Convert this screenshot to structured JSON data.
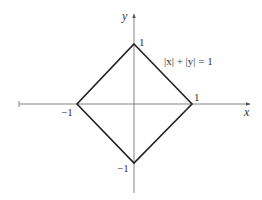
{
  "diagram": {
    "equation": "|x| + |y| = 1",
    "axes": {
      "x_label": "x",
      "y_label": "y"
    },
    "vertices": [
      {
        "name": "top",
        "x": 0,
        "y": 1,
        "label": "1"
      },
      {
        "name": "right",
        "x": 1,
        "y": 0,
        "label": "1"
      },
      {
        "name": "left",
        "x": -1,
        "y": 0,
        "label": "−1"
      },
      {
        "name": "bottom",
        "x": 0,
        "y": -1,
        "label": "−1"
      }
    ],
    "colors": {
      "axis": "#666666",
      "shape": "#222222",
      "text": "#333333",
      "background": "#ffffff"
    }
  }
}
